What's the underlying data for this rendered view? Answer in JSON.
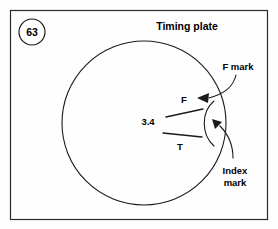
{
  "figure": {
    "number": "63",
    "title": "Timing plate"
  },
  "labels": {
    "f_mark_callout": "F mark",
    "index_mark_line1": "Index",
    "index_mark_line2": "mark",
    "f_mark": "F",
    "t_mark": "T",
    "value": "3.4"
  },
  "colors": {
    "ink": "#1a1a1a",
    "frame": "#2b2b2b",
    "background": "#fefefe"
  },
  "geometry": {
    "frame": {
      "x": 10,
      "y": 10,
      "width": 258,
      "height": 210
    },
    "plate_circle": {
      "cx": 144,
      "cy": 123,
      "r": 82
    },
    "figure_number_circle": {
      "cx": 32,
      "cy": 32,
      "r": 13
    }
  }
}
